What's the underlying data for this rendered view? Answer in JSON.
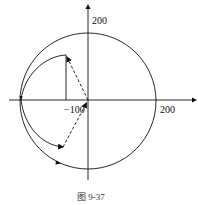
{
  "figure": {
    "caption": "图   9-37",
    "axis_labels": {
      "y_top": "200",
      "x_right": "200",
      "x_neg": "−100"
    },
    "colors": {
      "stroke": "#111111",
      "background": "#ffffff"
    }
  }
}
